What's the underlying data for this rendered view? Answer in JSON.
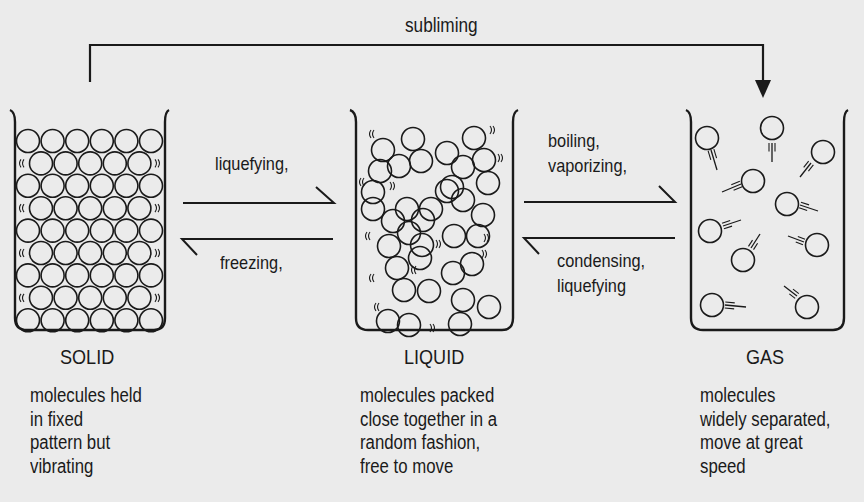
{
  "diagram": {
    "type": "states-of-matter",
    "background_color": "#ebebeb",
    "ink_color": "#1a1a1a",
    "top_transition": {
      "label": "subliming",
      "from": "SOLID",
      "to": "GAS"
    },
    "transitions_solid_liquid": {
      "forward": {
        "label": "liquefying,",
        "from": "SOLID",
        "to": "LIQUID"
      },
      "backward": {
        "label": "freezing,",
        "from": "LIQUID",
        "to": "SOLID"
      }
    },
    "transitions_liquid_gas": {
      "forward": {
        "label_lines": [
          "boiling,",
          "vaporizing,"
        ],
        "from": "LIQUID",
        "to": "GAS"
      },
      "backward": {
        "label_lines": [
          "condensing,",
          "liquefying"
        ],
        "from": "GAS",
        "to": "LIQUID"
      }
    },
    "states": [
      {
        "name": "SOLID",
        "description_lines": [
          "molecules held",
          "in fixed",
          "pattern but",
          "vibrating"
        ],
        "particle_arrangement": "close-packed hexagonal rows, 9 rows alternating 6 and 5 circles"
      },
      {
        "name": "LIQUID",
        "description_lines": [
          "molecules packed",
          "close together in a",
          "random fashion,",
          "free to move"
        ],
        "particle_arrangement": "randomly packed circles with motion marks"
      },
      {
        "name": "GAS",
        "description_lines": [
          "molecules",
          "widely separated,",
          "move at great",
          "speed"
        ],
        "particle_arrangement": "11 widely spaced circles with motion trails"
      }
    ]
  }
}
